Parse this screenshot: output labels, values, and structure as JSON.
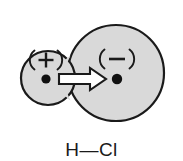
{
  "figure": {
    "formula_label": "H—Cl",
    "background_color": "#ffffff",
    "atom_fill_color": "#d9d9d9",
    "outline_color": "#1a1a1a",
    "arrow_fill_color": "#ffffff"
  },
  "atoms": [
    {
      "id": "hydrogen",
      "element": "H",
      "charge_symbol": "(+)",
      "charge_sign": "+",
      "cx": 48,
      "cy": 78,
      "r": 27,
      "nucleus_x": 46,
      "nucleus_y": 79,
      "nucleus_r": 4.6,
      "charge_x": 46,
      "charge_y": 60
    },
    {
      "id": "chlorine",
      "element": "Cl",
      "charge_symbol": "(−)",
      "charge_sign": "−",
      "cx": 116,
      "cy": 73,
      "r": 48,
      "nucleus_x": 117,
      "nucleus_y": 79,
      "nucleus_r": 5.2,
      "charge_x": 117,
      "charge_y": 59
    }
  ],
  "dipole_arrow": {
    "label": "dipole-moment-arrow",
    "direction": "right",
    "from_x": 59,
    "to_x": 106,
    "center_y": 79,
    "shaft_half_height": 5,
    "head_half_height": 11,
    "head_length": 16
  }
}
